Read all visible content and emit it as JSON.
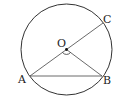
{
  "diagram": {
    "type": "circle-geometry",
    "points": {
      "O": {
        "label": "O",
        "role": "center"
      },
      "A": {
        "label": "A",
        "role": "on-circle"
      },
      "B": {
        "label": "B",
        "role": "on-circle"
      },
      "C": {
        "label": "C",
        "role": "on-circle"
      }
    },
    "segments": [
      "AC (diameter through O)",
      "AB (chord)",
      "OB (radius)"
    ],
    "angle_marked": "AOB",
    "stroke_color": "#333333"
  }
}
